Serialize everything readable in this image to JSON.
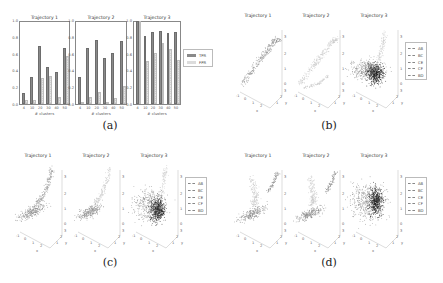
{
  "figure": {
    "captions": [
      "(a)",
      "(b)",
      "(c)",
      "(d)"
    ]
  },
  "chart_data": [
    {
      "type": "bar",
      "panel": "(a)",
      "title": "Trajectory 1",
      "categories": [
        "4",
        "10",
        "20",
        "30",
        "40",
        "50"
      ],
      "series": [
        {
          "name": "TPR",
          "values": [
            0.13,
            0.33,
            0.7,
            0.45,
            0.38,
            0.67
          ]
        },
        {
          "name": "FPR",
          "values": [
            0.05,
            0.05,
            0.31,
            0.34,
            0.09,
            0.58
          ]
        }
      ],
      "xlabel": "# clusters",
      "ylabel": "",
      "ylim": [
        0,
        1.0
      ],
      "yticks": [
        "0.0",
        "0.2",
        "0.4",
        "0.6",
        "0.8",
        "1.0"
      ]
    },
    {
      "type": "bar",
      "panel": "(a)",
      "title": "Trajectory 2",
      "categories": [
        "4",
        "10",
        "20",
        "30",
        "40",
        "50"
      ],
      "series": [
        {
          "name": "TPR",
          "values": [
            0.33,
            0.68,
            0.77,
            0.56,
            0.62,
            0.76
          ]
        },
        {
          "name": "FPR",
          "values": [
            0.0,
            0.08,
            0.14,
            0.02,
            0.07,
            0.22
          ]
        }
      ],
      "xlabel": "# clusters",
      "ylabel": "",
      "ylim": [
        0,
        1.0
      ],
      "yticks": [
        "0.0",
        "0.2",
        "0.4",
        "0.6",
        "0.8",
        "1.0"
      ]
    },
    {
      "type": "bar",
      "panel": "(a)",
      "title": "Trajectory 3",
      "categories": [
        "4",
        "10",
        "20",
        "30",
        "40",
        "50"
      ],
      "series": [
        {
          "name": "TPR",
          "values": [
            1.0,
            0.82,
            0.87,
            0.88,
            0.86,
            0.87
          ]
        },
        {
          "name": "FPR",
          "values": [
            1.0,
            0.52,
            0.61,
            0.74,
            0.66,
            0.53
          ]
        }
      ],
      "xlabel": "# clusters",
      "ylabel": "",
      "ylim": [
        0,
        1.0
      ],
      "yticks": [
        "0.0",
        "0.2",
        "0.4",
        "0.6",
        "0.8",
        "1.0"
      ],
      "legend": [
        "TPR",
        "FPR"
      ],
      "legend_position": "right"
    },
    {
      "type": "scatter",
      "panel": "(b)",
      "subplots": [
        "Trajectory 1",
        "Trajectory 2",
        "Trajectory 3"
      ],
      "projection": "3d",
      "legend": [
        "AB",
        "BC",
        "CE",
        "CF",
        "BD"
      ],
      "legend_position": "right"
    },
    {
      "type": "scatter",
      "panel": "(c)",
      "subplots": [
        "Trajectory 1",
        "Trajectory 2",
        "Trajectory 3"
      ],
      "projection": "3d",
      "legend": [
        "AB",
        "BC",
        "CE",
        "CF",
        "BD"
      ],
      "legend_position": "right"
    },
    {
      "type": "scatter",
      "panel": "(d)",
      "subplots": [
        "Trajectory 1",
        "Trajectory 2",
        "Trajectory 3"
      ],
      "projection": "3d",
      "legend": [
        "AB",
        "BC",
        "CE",
        "CF",
        "BD"
      ],
      "legend_position": "right"
    }
  ],
  "bar_legend": [
    "TPR",
    "FPR"
  ],
  "scatter_legend": [
    "AB",
    "BC",
    "CE",
    "CF",
    "BD"
  ],
  "scatter_titles": [
    "Trajectory 1",
    "Trajectory 2",
    "Trajectory 3"
  ],
  "colors": {
    "tpr": "#8a8a8a",
    "fpr": "#dcdcdc",
    "scatter_light": "#c8c8c8",
    "scatter_mid": "#8c8c8c",
    "scatter_dark": "#222222"
  }
}
